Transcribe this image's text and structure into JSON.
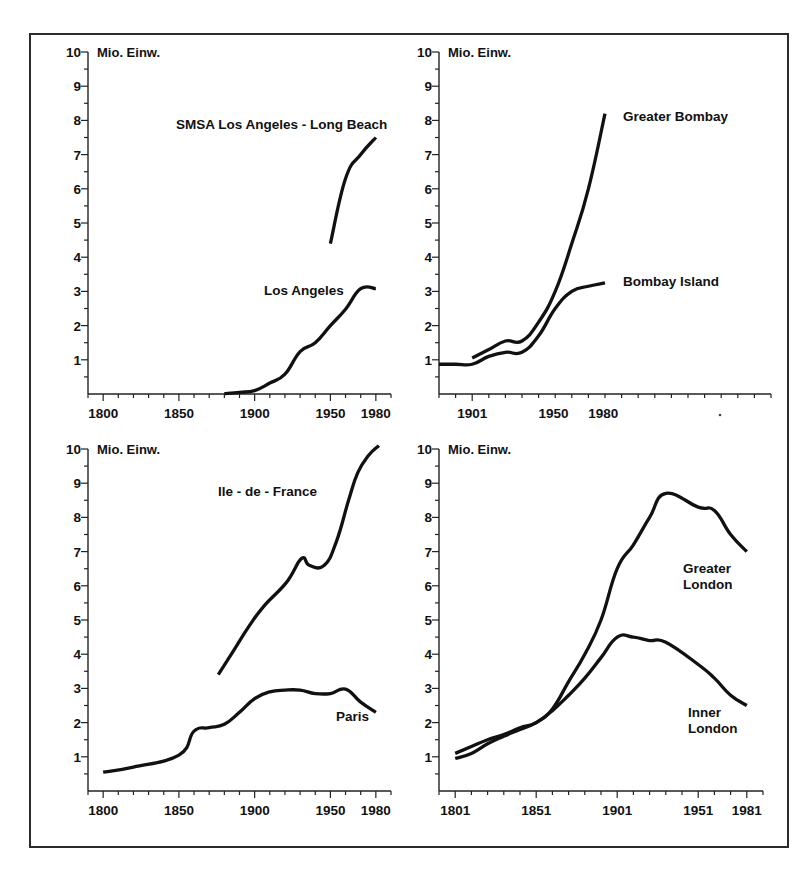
{
  "figure": {
    "axis_unit_label": "Mio. Einw.",
    "panel_count": 4
  },
  "chart_data": [
    {
      "id": "los-angeles",
      "type": "line",
      "title": "",
      "xlabel": "",
      "ylabel": "Mio. Einw.",
      "xlim": [
        1790,
        1990
      ],
      "ylim": [
        0,
        10
      ],
      "grid": false,
      "legend": "inline-labels",
      "xticks": [
        1800,
        1850,
        1900,
        1950,
        1980
      ],
      "xtick_labels": [
        "1800",
        "1850",
        "1900",
        "1950",
        "1980"
      ],
      "yticks": [
        1,
        2,
        3,
        4,
        5,
        6,
        7,
        8,
        9,
        10
      ],
      "ytick_labels": [
        "1",
        "2",
        "3",
        "4",
        "5",
        "6",
        "7",
        "8",
        "9",
        "10"
      ],
      "series": [
        {
          "name": "SMSA Los Angeles - Long Beach",
          "label": "SMSA Los Angeles - Long Beach",
          "x": [
            1950,
            1960,
            1970,
            1980
          ],
          "values": [
            4.4,
            6.3,
            7.0,
            7.5
          ]
        },
        {
          "name": "Los Angeles",
          "label": "Los Angeles",
          "x": [
            1880,
            1890,
            1900,
            1910,
            1920,
            1930,
            1940,
            1950,
            1960,
            1970,
            1980
          ],
          "values": [
            0.01,
            0.05,
            0.1,
            0.32,
            0.58,
            1.24,
            1.5,
            2.0,
            2.48,
            3.08,
            3.08
          ]
        }
      ]
    },
    {
      "id": "bombay",
      "type": "line",
      "title": "",
      "xlabel": "",
      "ylabel": "Mio. Einw.",
      "xlim": [
        1881,
        2081
      ],
      "ylim": [
        0,
        10
      ],
      "grid": false,
      "legend": "inline-labels",
      "xticks": [
        1901,
        1950,
        1980
      ],
      "xtick_labels": [
        "1901",
        "1950",
        "1980"
      ],
      "yticks": [
        1,
        2,
        3,
        4,
        5,
        6,
        7,
        8,
        9,
        10
      ],
      "ytick_labels": [
        "1",
        "2",
        "3",
        "4",
        "5",
        "6",
        "7",
        "8",
        "9",
        "10"
      ],
      "series": [
        {
          "name": "Greater Bombay",
          "label": "Greater Bombay",
          "x": [
            1901,
            1911,
            1921,
            1931,
            1941,
            1951,
            1961,
            1971,
            1981
          ],
          "values": [
            1.05,
            1.3,
            1.55,
            1.55,
            2.1,
            3.0,
            4.4,
            6.0,
            8.2
          ]
        },
        {
          "name": "Bombay Island",
          "label": "Bombay Island",
          "x": [
            1881,
            1891,
            1901,
            1911,
            1921,
            1931,
            1941,
            1951,
            1961,
            1971,
            1981
          ],
          "values": [
            0.87,
            0.87,
            0.87,
            1.1,
            1.22,
            1.22,
            1.7,
            2.5,
            3.0,
            3.15,
            3.25
          ]
        }
      ]
    },
    {
      "id": "paris",
      "type": "line",
      "title": "",
      "xlabel": "",
      "ylabel": "Mio. Einw.",
      "xlim": [
        1790,
        1990
      ],
      "ylim": [
        0,
        10
      ],
      "grid": false,
      "legend": "inline-labels",
      "xticks": [
        1800,
        1850,
        1900,
        1950,
        1980
      ],
      "xtick_labels": [
        "1800",
        "1850",
        "1900",
        "1950",
        "1980"
      ],
      "yticks": [
        1,
        2,
        3,
        4,
        5,
        6,
        7,
        8,
        9,
        10
      ],
      "ytick_labels": [
        "1",
        "2",
        "3",
        "4",
        "5",
        "6",
        "7",
        "8",
        "9",
        "10"
      ],
      "series": [
        {
          "name": "Ile - de - France",
          "label": "Ile - de - France",
          "x": [
            1876,
            1886,
            1896,
            1906,
            1921,
            1931,
            1936,
            1946,
            1954,
            1962,
            1968,
            1975,
            1982
          ],
          "values": [
            3.4,
            4.1,
            4.8,
            5.4,
            6.1,
            6.8,
            6.6,
            6.6,
            7.3,
            8.5,
            9.3,
            9.8,
            10.1
          ]
        },
        {
          "name": "Paris",
          "label": "Paris",
          "x": [
            1800,
            1820,
            1850,
            1860,
            1870,
            1880,
            1890,
            1900,
            1910,
            1920,
            1930,
            1940,
            1950,
            1960,
            1970,
            1980
          ],
          "values": [
            0.55,
            0.7,
            1.05,
            1.75,
            1.85,
            1.95,
            2.3,
            2.7,
            2.9,
            2.95,
            2.95,
            2.85,
            2.85,
            2.98,
            2.6,
            2.3
          ]
        }
      ]
    },
    {
      "id": "london",
      "type": "line",
      "title": "",
      "xlabel": "",
      "ylabel": "Mio. Einw.",
      "xlim": [
        1791,
        1991
      ],
      "ylim": [
        0,
        10
      ],
      "grid": false,
      "legend": "inline-labels",
      "xticks": [
        1801,
        1851,
        1901,
        1951,
        1981
      ],
      "xtick_labels": [
        "1801",
        "1851",
        "1901",
        "1951",
        "1981"
      ],
      "yticks": [
        1,
        2,
        3,
        4,
        5,
        6,
        7,
        8,
        9,
        10
      ],
      "ytick_labels": [
        "1",
        "2",
        "3",
        "4",
        "5",
        "6",
        "7",
        "8",
        "9",
        "10"
      ],
      "series": [
        {
          "name": "Greater London",
          "label": "Greater London",
          "label_line1": "Greater",
          "label_line2": "London",
          "x": [
            1801,
            1811,
            1821,
            1831,
            1841,
            1851,
            1861,
            1871,
            1881,
            1891,
            1901,
            1911,
            1921,
            1931,
            1951,
            1961,
            1971,
            1981
          ],
          "values": [
            1.1,
            1.3,
            1.5,
            1.65,
            1.85,
            2.0,
            2.4,
            3.2,
            4.0,
            5.0,
            6.5,
            7.2,
            8.0,
            8.7,
            8.3,
            8.2,
            7.5,
            7.0
          ]
        },
        {
          "name": "Inner London",
          "label": "Inner London",
          "label_line1": "Inner",
          "label_line2": "London",
          "x": [
            1801,
            1811,
            1821,
            1831,
            1841,
            1851,
            1861,
            1871,
            1881,
            1891,
            1901,
            1911,
            1921,
            1931,
            1951,
            1961,
            1971,
            1981
          ],
          "values": [
            0.95,
            1.1,
            1.38,
            1.6,
            1.8,
            2.0,
            2.35,
            2.8,
            3.3,
            3.9,
            4.5,
            4.5,
            4.4,
            4.35,
            3.7,
            3.3,
            2.8,
            2.5
          ]
        }
      ]
    }
  ]
}
